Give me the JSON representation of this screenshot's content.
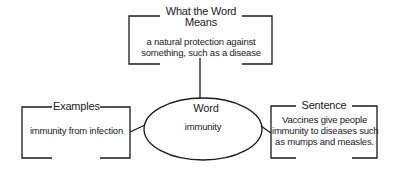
{
  "diagram": {
    "type": "vocabulary word map",
    "center": {
      "label": "Word",
      "value": "immunity"
    },
    "top_box": {
      "title_line1": "What the Word",
      "title_line2": "Means",
      "text_line1": "a natural protection against",
      "text_line2": "something, such as a disease"
    },
    "left_box": {
      "title": "Examples",
      "text": "immunity from infection"
    },
    "right_box": {
      "title": "Sentence",
      "text_line1": "Vaccines give people",
      "text_line2": "immunity to diseases such",
      "text_line3": "as mumps and measles."
    },
    "colors": {
      "line": "#1a1a1a",
      "background": "#ffffff"
    }
  }
}
